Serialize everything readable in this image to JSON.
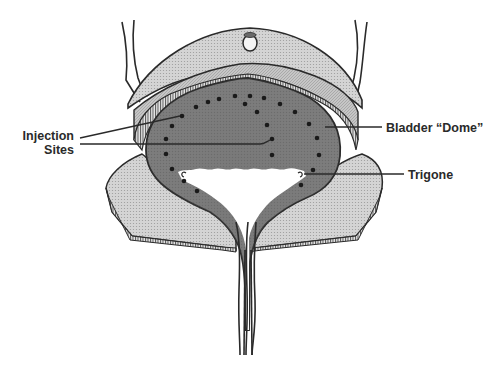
{
  "diagram": {
    "labels": {
      "injection_line1": "Injection",
      "injection_line2": "Sites",
      "bladder_dome": "Bladder “Dome”",
      "trigone": "Trigone"
    },
    "colors": {
      "outline": "#2a2a2a",
      "bladder_lumen": "#7a7a7a",
      "wall_light": "#c8c8c8",
      "wall_mid": "#b0b0b0",
      "peritoneum": "#d8d8d8",
      "dots": "#1a1a1a",
      "trigone_area": "#ffffff"
    },
    "injection_sites": [
      [
        196,
        107
      ],
      [
        208,
        102
      ],
      [
        219,
        99
      ],
      [
        235,
        96
      ],
      [
        250,
        96
      ],
      [
        264,
        98
      ],
      [
        245,
        104
      ],
      [
        280,
        104
      ],
      [
        295,
        112
      ],
      [
        257,
        112
      ],
      [
        182,
        116
      ],
      [
        172,
        126
      ],
      [
        166,
        139
      ],
      [
        166,
        154
      ],
      [
        172,
        169
      ],
      [
        184,
        181
      ],
      [
        197,
        191
      ],
      [
        267,
        125
      ],
      [
        272,
        139
      ],
      [
        272,
        155
      ],
      [
        309,
        124
      ],
      [
        317,
        138
      ],
      [
        319,
        155
      ],
      [
        313,
        170
      ],
      [
        301,
        185
      ]
    ],
    "ureteral_orifices": [
      [
        183,
        175
      ],
      [
        300,
        175
      ]
    ]
  }
}
